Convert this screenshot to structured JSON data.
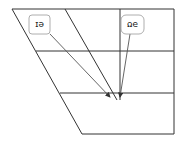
{
  "diagram": {
    "type": "vowel-trapezoid",
    "orientation": "rotated-180",
    "labels": [
      {
        "id": "left",
        "text": "eɪ"
      },
      {
        "id": "right",
        "text": "əʊ"
      }
    ],
    "colors": {
      "line": "#333333",
      "arrow": "#555555",
      "box_border": "#999999"
    }
  }
}
